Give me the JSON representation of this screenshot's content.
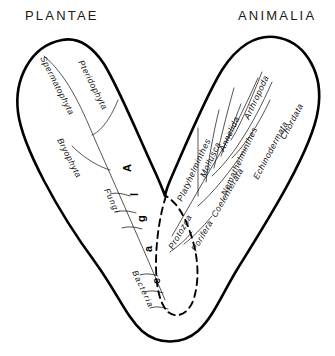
{
  "headings": {
    "left": "PLANTAE",
    "right": "ANIMALIA"
  },
  "colors": {
    "outline": "#000000",
    "background": "#ffffff",
    "text": "#111111",
    "branch_line": "#1c1c1c"
  },
  "left_branch": {
    "name": "PLANTAE",
    "taxa": [
      {
        "label": "Spermatophyta"
      },
      {
        "label": "Pteridophyta"
      },
      {
        "label": "Bryophyta"
      },
      {
        "label": "Fungi"
      },
      {
        "label": "Bacteria"
      }
    ],
    "trunk_label_letters": [
      "A",
      "l",
      "g",
      "a",
      "e"
    ],
    "trunk_label": "Algae"
  },
  "right_branch": {
    "name": "ANIMALIA",
    "taxa": [
      {
        "label": "Chordata"
      },
      {
        "label": "Echinodermata"
      },
      {
        "label": "Arthropoda"
      },
      {
        "label": "Nemathelminthes"
      },
      {
        "label": "Annelida"
      },
      {
        "label": "Mollusca"
      },
      {
        "label": "Platyhelminthes"
      },
      {
        "label": "Coelenterata"
      },
      {
        "label": "Porifera"
      },
      {
        "label": "Protozoa"
      }
    ]
  },
  "dashed_region": {
    "label": "Protozoa",
    "style": "dashed"
  }
}
